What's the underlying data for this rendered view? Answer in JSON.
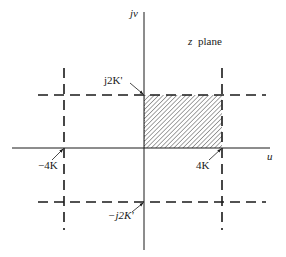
{
  "diagram": {
    "title": "z plane",
    "title_var": "z",
    "title_word": "plane",
    "axes": {
      "horizontal_label": "u",
      "vertical_label": "jv"
    },
    "annotations": {
      "top": "j2K'",
      "bottom": "−j2K'",
      "left": "−4K",
      "right": "4K"
    },
    "lines": {
      "dashed_vertical_positions": [
        "-4K",
        "4K"
      ],
      "dashed_horizontal_positions": [
        "j2K'",
        "-j2K'"
      ]
    },
    "shaded_region": {
      "description": "rectangle from 0 to 4K along u, 0 to j2K' along jv",
      "pattern": "diagonal hatching"
    },
    "colors": {
      "ink": "#1a1a1a",
      "background": "#ffffff"
    }
  }
}
